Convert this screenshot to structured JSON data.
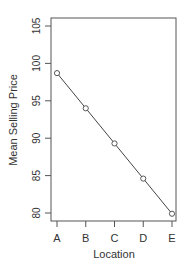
{
  "chart_data": {
    "type": "line",
    "title": "",
    "xlabel": "Location",
    "ylabel": "Mean Selling Price",
    "categories": [
      "A",
      "B",
      "C",
      "D",
      "E"
    ],
    "values": [
      98.7,
      94.0,
      89.3,
      84.6,
      79.9
    ],
    "ylim": [
      80,
      105
    ],
    "yticks": [
      80,
      85,
      90,
      95,
      100,
      105
    ],
    "grid": false,
    "legend": null,
    "markers": "open-circle",
    "line_color": "#444444"
  },
  "axes": {
    "xlabel": "Location",
    "ylabel": "Mean Selling Price"
  }
}
